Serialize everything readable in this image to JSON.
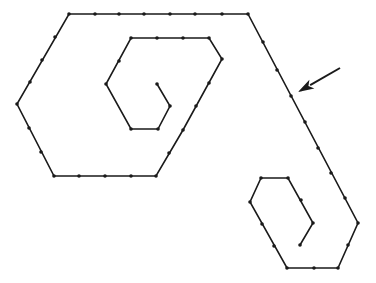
{
  "figure": {
    "line_color": "#1a1a1a",
    "background_color": "#ffffff",
    "spiral_path": {
      "points": [
        [
          157,
          84
        ],
        [
          170,
          106
        ],
        [
          158,
          129
        ],
        [
          131,
          129
        ],
        [
          106,
          84
        ],
        [
          131,
          38
        ],
        [
          209,
          38
        ],
        [
          222,
          59
        ],
        [
          183,
          130
        ],
        [
          156,
          176
        ],
        [
          54,
          176
        ],
        [
          17,
          104
        ],
        [
          69,
          14
        ],
        [
          248,
          14
        ],
        [
          358,
          223
        ],
        [
          338,
          268
        ],
        [
          287,
          268
        ],
        [
          250,
          202
        ],
        [
          261,
          178
        ],
        [
          288,
          178
        ],
        [
          313,
          223
        ],
        [
          300,
          245
        ]
      ],
      "dots": [
        [
          157,
          84
        ],
        [
          170,
          106
        ],
        [
          158,
          129
        ],
        [
          131,
          129
        ],
        [
          106,
          84
        ],
        [
          119,
          61
        ],
        [
          131,
          38
        ],
        [
          157,
          38
        ],
        [
          183,
          38
        ],
        [
          209,
          38
        ],
        [
          222,
          59
        ],
        [
          209,
          83
        ],
        [
          196,
          106
        ],
        [
          183,
          130
        ],
        [
          169,
          153
        ],
        [
          156,
          176
        ],
        [
          131,
          176
        ],
        [
          105,
          176
        ],
        [
          79,
          176
        ],
        [
          54,
          176
        ],
        [
          41,
          152
        ],
        [
          29,
          128
        ],
        [
          17,
          104
        ],
        [
          30,
          82
        ],
        [
          42,
          60
        ],
        [
          55,
          37
        ],
        [
          69,
          14
        ],
        [
          95,
          14
        ],
        [
          119,
          14
        ],
        [
          144,
          14
        ],
        [
          170,
          14
        ],
        [
          195,
          14
        ],
        [
          222,
          14
        ],
        [
          248,
          14
        ],
        [
          263,
          42
        ],
        [
          277,
          70
        ],
        [
          291,
          96
        ],
        [
          305,
          122
        ],
        [
          318,
          148
        ],
        [
          331,
          173
        ],
        [
          345,
          198
        ],
        [
          358,
          223
        ],
        [
          348,
          245
        ],
        [
          338,
          268
        ],
        [
          314,
          268
        ],
        [
          287,
          268
        ],
        [
          274,
          246
        ],
        [
          262,
          224
        ],
        [
          250,
          202
        ],
        [
          261,
          178
        ],
        [
          288,
          178
        ],
        [
          301,
          200
        ],
        [
          313,
          223
        ],
        [
          300,
          245
        ]
      ]
    },
    "arrow": {
      "tail": [
        340,
        68
      ],
      "tip": [
        298,
        92
      ],
      "semantic": "pointer-arrow"
    }
  }
}
